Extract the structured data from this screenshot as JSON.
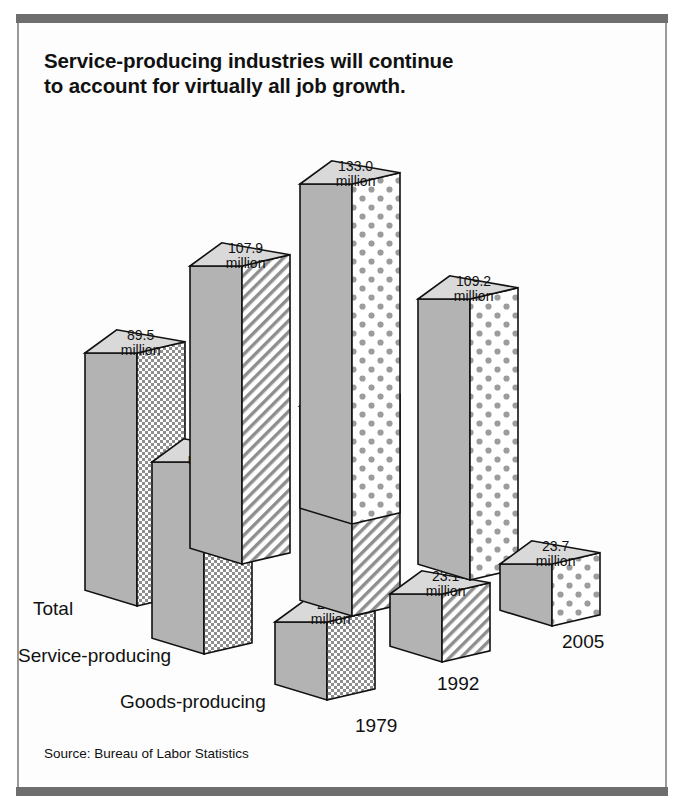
{
  "title": {
    "line1": "Service-producing industries will continue",
    "line2": "to account for virtually all job growth."
  },
  "source": "Source: Bureau of Labor Statistics",
  "colors": {
    "frame_bar": "#6e6e6e",
    "face_left": "#b3b3b3",
    "face_top": "#d9d9d9",
    "face_right_fill": "#c9c9c9",
    "outline": "#111111",
    "background": "#ffffff"
  },
  "labels": {
    "categories": [
      "Total",
      "Service-producing",
      "Goods-producing"
    ],
    "years": [
      "1979",
      "1992",
      "2005"
    ],
    "unit": "million"
  },
  "chart_data": {
    "type": "bar",
    "title": "Service-producing industries will continue to account for virtually all job growth.",
    "subtitle": "",
    "xlabel": "",
    "ylabel": "Employment (millions)",
    "categories": [
      "1979",
      "1992",
      "2005"
    ],
    "series": [
      {
        "name": "Total",
        "values": [
          89.5,
          107.9,
          133.0
        ],
        "pattern": "checker"
      },
      {
        "name": "Service-producing",
        "values": [
          63.0,
          84.7,
          109.2
        ],
        "pattern": "diagonal"
      },
      {
        "name": "Goods-producing",
        "values": [
          26.5,
          23.1,
          23.7
        ],
        "pattern": "dots"
      }
    ],
    "value_labels": [
      "89.5 million",
      "107.9 million",
      "133.0 million",
      "63.0 million",
      "84.7 million",
      "109.2 million",
      "26.5 million",
      "23.1 million",
      "23.7 million"
    ],
    "ylim": [
      0,
      133
    ],
    "grid": false,
    "legend": "inline-axis-labels",
    "projection": "isometric-3d",
    "annotations": [
      "Source: Bureau of Labor Statistics"
    ]
  },
  "bars": [
    {
      "id": "total-1979",
      "value": "89.5",
      "unit": "million",
      "pattern": "checker",
      "x": 85,
      "base": 606,
      "h": 253,
      "w": 100,
      "d": 48
    },
    {
      "id": "service-1979",
      "value": "63.0",
      "unit": "million",
      "pattern": "checker",
      "x": 152,
      "base": 654,
      "h": 192,
      "w": 100,
      "d": 48
    },
    {
      "id": "goods-1979",
      "value": "26.5",
      "unit": "million",
      "pattern": "checker",
      "x": 275,
      "base": 700,
      "h": 78,
      "w": 100,
      "d": 48
    },
    {
      "id": "total-1992",
      "value": "107.9",
      "unit": "million",
      "pattern": "diagonal",
      "x": 190,
      "base": 564,
      "h": 298,
      "w": 100,
      "d": 48
    },
    {
      "id": "service-1992",
      "value": "84.7",
      "unit": "million",
      "pattern": "diagonal",
      "x": 300,
      "base": 616,
      "h": 210,
      "w": 100,
      "d": 48
    },
    {
      "id": "goods-1992",
      "value": "23.1",
      "unit": "million",
      "pattern": "diagonal",
      "x": 390,
      "base": 662,
      "h": 68,
      "w": 100,
      "d": 48
    },
    {
      "id": "total-2005",
      "value": "133.0",
      "unit": "million",
      "pattern": "dots",
      "x": 300,
      "base": 524,
      "h": 340,
      "w": 100,
      "d": 48
    },
    {
      "id": "service-2005",
      "value": "109.2",
      "unit": "million",
      "pattern": "dots",
      "x": 418,
      "base": 580,
      "h": 281,
      "w": 100,
      "d": 48
    },
    {
      "id": "goods-2005",
      "value": "23.7",
      "unit": "million",
      "pattern": "dots",
      "x": 500,
      "base": 626,
      "h": 62,
      "w": 100,
      "d": 48
    }
  ],
  "axis_text": [
    {
      "name": "Total",
      "x": 33,
      "y": 615
    },
    {
      "name": "Service-producing",
      "x": 18,
      "y": 662
    },
    {
      "name": "Goods-producing",
      "x": 120,
      "y": 708
    },
    {
      "name": "1979",
      "x": 355,
      "y": 732
    },
    {
      "name": "1992",
      "x": 437,
      "y": 690
    },
    {
      "name": "2005",
      "x": 562,
      "y": 648
    }
  ]
}
